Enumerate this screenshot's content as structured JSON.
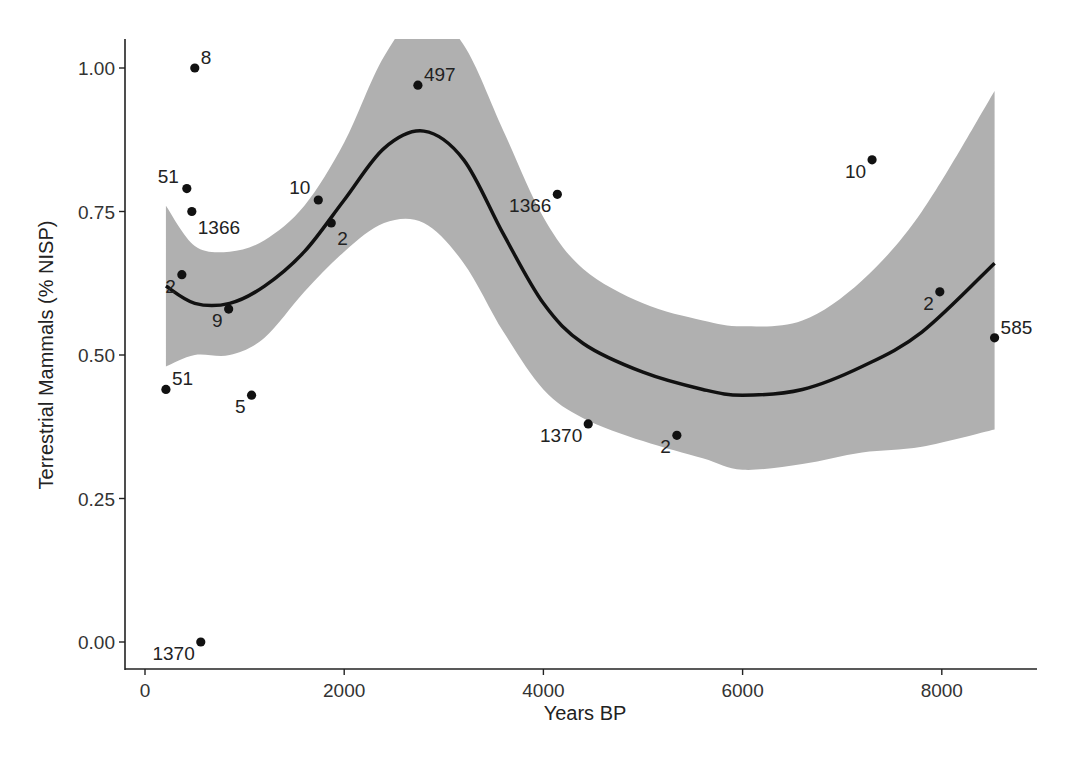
{
  "chart_data": {
    "type": "scatter",
    "title": "",
    "xlabel": "Years BP",
    "ylabel": "Terrestrial Mammals (% NISP)",
    "xlim": [
      -120,
      9000
    ],
    "ylim": [
      -0.05,
      1.05
    ],
    "x_ticks": [
      0,
      2000,
      4000,
      6000,
      8000
    ],
    "x_tick_labels": [
      "0",
      "2000",
      "4000",
      "6000",
      "8000"
    ],
    "y_ticks": [
      0.0,
      0.25,
      0.5,
      0.75,
      1.0
    ],
    "y_tick_labels": [
      "0.00",
      "0.25",
      "0.50",
      "0.75",
      "1.00"
    ],
    "grid": false,
    "legend": null,
    "points": [
      {
        "x": 500,
        "y": 1.0,
        "label": "8",
        "anchor": "ur"
      },
      {
        "x": 420,
        "y": 0.79,
        "label": "51",
        "anchor": "ul"
      },
      {
        "x": 470,
        "y": 0.75,
        "label": "1366",
        "anchor": "lr"
      },
      {
        "x": 370,
        "y": 0.64,
        "label": "2",
        "anchor": "ll"
      },
      {
        "x": 210,
        "y": 0.44,
        "label": "51",
        "anchor": "ur"
      },
      {
        "x": 840,
        "y": 0.58,
        "label": "9",
        "anchor": "ll"
      },
      {
        "x": 1070,
        "y": 0.43,
        "label": "5",
        "anchor": "ll"
      },
      {
        "x": 560,
        "y": 0.0,
        "label": "1370",
        "anchor": "ll"
      },
      {
        "x": 1740,
        "y": 0.77,
        "label": "10",
        "anchor": "ul"
      },
      {
        "x": 1870,
        "y": 0.73,
        "label": "2",
        "anchor": "lr"
      },
      {
        "x": 2740,
        "y": 0.97,
        "label": "497",
        "anchor": "ur"
      },
      {
        "x": 4140,
        "y": 0.78,
        "label": "1366",
        "anchor": "ll"
      },
      {
        "x": 4450,
        "y": 0.38,
        "label": "1370",
        "anchor": "ll"
      },
      {
        "x": 5340,
        "y": 0.36,
        "label": "2",
        "anchor": "ll"
      },
      {
        "x": 7300,
        "y": 0.84,
        "label": "10",
        "anchor": "ll"
      },
      {
        "x": 7980,
        "y": 0.61,
        "label": "2",
        "anchor": "ll"
      },
      {
        "x": 8530,
        "y": 0.53,
        "label": "585",
        "anchor": "ur"
      }
    ],
    "smooth_fit": {
      "method": "loess",
      "x": [
        210,
        500,
        850,
        1200,
        1600,
        2000,
        2400,
        2800,
        3200,
        3600,
        4000,
        4400,
        5000,
        5600,
        6000,
        6600,
        7200,
        7800,
        8530
      ],
      "y": [
        0.62,
        0.59,
        0.59,
        0.62,
        0.68,
        0.77,
        0.86,
        0.89,
        0.84,
        0.71,
        0.59,
        0.52,
        0.47,
        0.44,
        0.43,
        0.44,
        0.48,
        0.54,
        0.66
      ],
      "upper": [
        0.76,
        0.69,
        0.68,
        0.7,
        0.76,
        0.87,
        1.02,
        1.1,
        1.04,
        0.89,
        0.74,
        0.65,
        0.59,
        0.56,
        0.55,
        0.56,
        0.63,
        0.75,
        0.96
      ],
      "lower": [
        0.48,
        0.5,
        0.5,
        0.53,
        0.61,
        0.68,
        0.73,
        0.73,
        0.66,
        0.54,
        0.44,
        0.39,
        0.35,
        0.32,
        0.3,
        0.31,
        0.33,
        0.34,
        0.37
      ]
    },
    "colors": {
      "points": "#111111",
      "line": "#111111",
      "band": "#b0b0b0",
      "axis": "#222222"
    }
  }
}
